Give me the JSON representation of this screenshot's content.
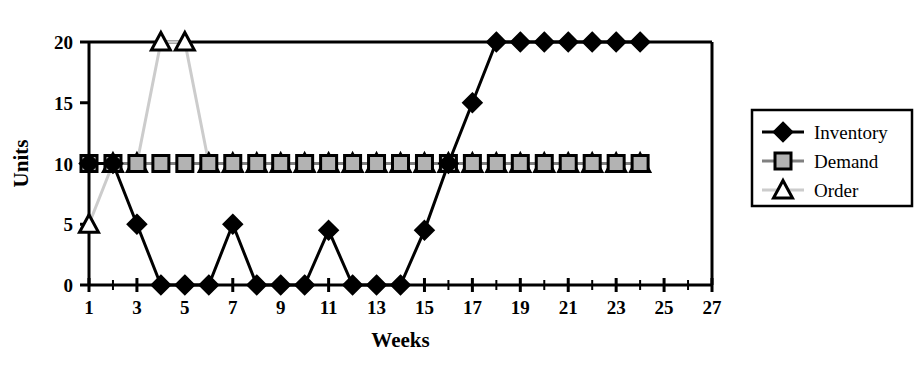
{
  "chart_data": {
    "type": "line",
    "title": "",
    "xlabel": "Weeks",
    "ylabel": "Units",
    "xlim": [
      1,
      27
    ],
    "ylim": [
      0,
      20
    ],
    "grid": false,
    "legend_position": "right",
    "x": [
      1,
      2,
      3,
      4,
      5,
      6,
      7,
      8,
      9,
      10,
      11,
      12,
      13,
      14,
      15,
      16,
      17,
      18,
      19,
      20,
      21,
      22,
      23,
      24
    ],
    "xticks_major": [
      1,
      3,
      5,
      7,
      9,
      11,
      13,
      15,
      17,
      19,
      21,
      23,
      25,
      27
    ],
    "xticklabels": [
      "1",
      "3",
      "5",
      "7",
      "9",
      "11",
      "13",
      "15",
      "17",
      "19",
      "21",
      "23",
      "25",
      "27"
    ],
    "xticks_all": [
      1,
      2,
      3,
      4,
      5,
      6,
      7,
      8,
      9,
      10,
      11,
      12,
      13,
      14,
      15,
      16,
      17,
      18,
      19,
      20,
      21,
      22,
      23,
      24,
      25,
      26,
      27
    ],
    "yticks": [
      0,
      5,
      10,
      15,
      20
    ],
    "yticklabels": [
      "0",
      "5",
      "10",
      "15",
      "20"
    ],
    "series": [
      {
        "name": "Inventory",
        "marker": "diamond",
        "marker_fill": "#000000",
        "line_color": "#000000",
        "values": [
          10,
          10,
          5,
          0,
          0,
          0,
          5,
          0,
          0,
          0,
          4.5,
          0,
          0,
          0,
          4.5,
          10,
          15,
          20,
          20,
          20,
          20,
          20,
          20,
          20
        ]
      },
      {
        "name": "Demand",
        "marker": "square",
        "marker_fill": "#b3b3b3",
        "line_color": "#808080",
        "values": [
          10,
          10,
          10,
          10,
          10,
          10,
          10,
          10,
          10,
          10,
          10,
          10,
          10,
          10,
          10,
          10,
          10,
          10,
          10,
          10,
          10,
          10,
          10,
          10
        ]
      },
      {
        "name": "Order",
        "marker": "triangle",
        "marker_fill": "#ffffff",
        "line_color": "#cccccc",
        "values": [
          5,
          10,
          10,
          20,
          20,
          10,
          10,
          10,
          10,
          10,
          10,
          10,
          10,
          10,
          10,
          10,
          10,
          10,
          10,
          10,
          10,
          10,
          10,
          10
        ]
      }
    ]
  },
  "legend": {
    "items": [
      {
        "label": "Inventory"
      },
      {
        "label": "Demand"
      },
      {
        "label": "Order"
      }
    ]
  },
  "axes": {
    "y_title": "Units",
    "x_title": "Weeks"
  }
}
